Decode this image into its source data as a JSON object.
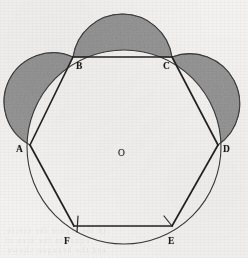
{
  "figure": {
    "caption_visible": false,
    "background_color": "#f3f2f0",
    "ink_color": "#2b2b2b",
    "shade_color": "#9a9a9a",
    "canvas": {
      "width": 248,
      "height": 258
    },
    "circle": {
      "name": "circumscribed-circle",
      "center": {
        "x": 124,
        "y": 147
      },
      "radius": 97,
      "stroke": "#3a3a3a",
      "stroke_width": 1.1
    },
    "center_point": {
      "label": "O",
      "x": 124,
      "y": 147,
      "label_x": 118,
      "label_y": 156
    },
    "vertices": [
      {
        "label": "A",
        "x": 30,
        "y": 145,
        "label_x": 16,
        "label_y": 151
      },
      {
        "label": "B",
        "x": 73,
        "y": 57,
        "label_x": 76,
        "label_y": 68
      },
      {
        "label": "C",
        "x": 172,
        "y": 57,
        "label_x": 163,
        "label_y": 68
      },
      {
        "label": "D",
        "x": 218,
        "y": 145,
        "label_x": 223,
        "label_y": 151
      },
      {
        "label": "E",
        "x": 172,
        "y": 226,
        "label_x": 168,
        "label_y": 243
      },
      {
        "label": "F",
        "x": 74,
        "y": 226,
        "label_x": 64,
        "label_y": 243
      }
    ],
    "hexagon_edges": [
      {
        "from": "A",
        "to": "B"
      },
      {
        "from": "B",
        "to": "C"
      },
      {
        "from": "C",
        "to": "D"
      },
      {
        "from": "D",
        "to": "E"
      },
      {
        "from": "E",
        "to": "F"
      },
      {
        "from": "F",
        "to": "A"
      }
    ],
    "diameter_segment": {
      "from": "A",
      "to": "D",
      "through": "O"
    },
    "lunes": [
      {
        "name": "lune-on-AB",
        "chord_from": "A",
        "chord_to": "B",
        "outer_semicircle_radius": 49,
        "shaded": true
      },
      {
        "name": "lune-on-BC",
        "chord_from": "B",
        "chord_to": "C",
        "outer_semicircle_radius": 50,
        "shaded": true
      },
      {
        "name": "lune-on-CD",
        "chord_from": "C",
        "chord_to": "D",
        "outer_semicircle_radius": 50,
        "shaded": true
      }
    ],
    "tick_marks": [
      {
        "name": "tick-at-F",
        "x": 78,
        "y": 218,
        "angle": 8
      },
      {
        "name": "tick-at-E",
        "x": 166,
        "y": 218,
        "angle": 28
      }
    ],
    "ghost_text": [
      {
        "text": "in the figure the circle",
        "x": 6,
        "y": 228
      },
      {
        "text": "equal to the area of",
        "x": 4,
        "y": 238
      },
      {
        "text": "and the hexagon shown",
        "x": 6,
        "y": 248
      }
    ]
  }
}
